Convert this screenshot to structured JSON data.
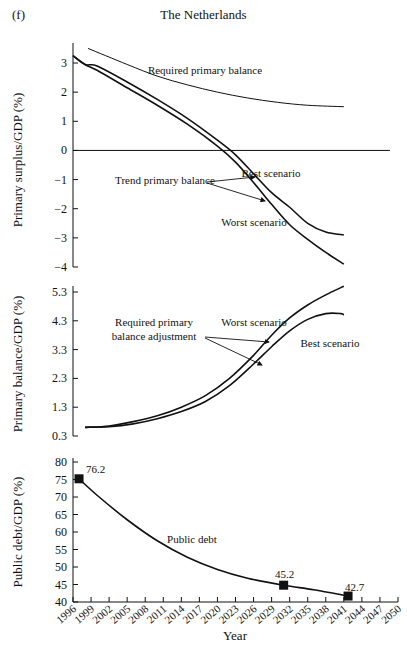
{
  "figure": {
    "panel_label": "(f)",
    "title": "The Netherlands",
    "xlabel": "Year"
  },
  "chart_data": [
    {
      "type": "line",
      "title": "The Netherlands",
      "ylabel": "Primary surplus/GDP (%)",
      "ylim": [
        -4,
        3.5
      ],
      "yticks": [
        3,
        2,
        1,
        0,
        -1,
        -2,
        -3,
        -4
      ],
      "xlim": [
        1996,
        2050
      ],
      "grid": false,
      "reference_line": 0,
      "series": [
        {
          "name": "Required primary balance",
          "x": [
            1998.5,
            2005,
            2010,
            2015,
            2020,
            2025,
            2030,
            2035,
            2041
          ],
          "y": [
            3.5,
            2.95,
            2.55,
            2.25,
            2.0,
            1.8,
            1.65,
            1.55,
            1.5
          ]
        },
        {
          "name": "Trend primary balance – Best scenario",
          "x": [
            1996,
            1998,
            2000,
            2005,
            2010,
            2015,
            2020,
            2023,
            2026,
            2029,
            2032,
            2035,
            2038,
            2041
          ],
          "y": [
            3.25,
            2.95,
            2.9,
            2.35,
            1.75,
            1.1,
            0.35,
            -0.15,
            -0.8,
            -1.45,
            -1.95,
            -2.5,
            -2.8,
            -2.9
          ]
        },
        {
          "name": "Trend primary balance – Worst scenario",
          "x": [
            1996,
            1998,
            2000,
            2005,
            2010,
            2015,
            2020,
            2023,
            2026,
            2029,
            2032,
            2035,
            2038,
            2041
          ],
          "y": [
            3.25,
            2.95,
            2.75,
            2.15,
            1.55,
            0.9,
            0.15,
            -0.4,
            -1.1,
            -1.85,
            -2.55,
            -3.05,
            -3.5,
            -3.9
          ]
        }
      ],
      "annotations": [
        "Required primary balance",
        "Trend primary balance",
        "Best scenario",
        "Worst scenario"
      ]
    },
    {
      "type": "line",
      "ylabel": "Primary balance/GDP (%)",
      "ylim": [
        0.3,
        5.3
      ],
      "yticks": [
        5.3,
        4.3,
        3.3,
        2.3,
        1.3,
        0.3
      ],
      "xlim": [
        1996,
        2050
      ],
      "grid": false,
      "series": [
        {
          "name": "Required primary balance adjustment – Worst scenario",
          "x": [
            1998,
            2002,
            2006,
            2010,
            2014,
            2018,
            2022,
            2026,
            2029,
            2032,
            2035,
            2038,
            2041
          ],
          "y": [
            0.6,
            0.65,
            0.8,
            1.0,
            1.3,
            1.7,
            2.3,
            3.1,
            3.8,
            4.4,
            4.85,
            5.2,
            5.5
          ]
        },
        {
          "name": "Required primary balance adjustment – Best scenario",
          "x": [
            1998,
            2002,
            2006,
            2010,
            2014,
            2018,
            2022,
            2026,
            2029,
            2032,
            2035,
            2038,
            2040.5,
            2041
          ],
          "y": [
            0.6,
            0.62,
            0.72,
            0.9,
            1.15,
            1.5,
            2.05,
            2.8,
            3.4,
            3.95,
            4.35,
            4.55,
            4.55,
            4.5
          ]
        }
      ],
      "annotations": [
        "Required primary balance adjustment",
        "Worst scenario",
        "Best scenario"
      ]
    },
    {
      "type": "line",
      "ylabel": "Public debt/GDP (%)",
      "xlabel": "Year",
      "ylim": [
        40,
        80
      ],
      "yticks": [
        80,
        75,
        70,
        65,
        60,
        55,
        50,
        45,
        40
      ],
      "xlim": [
        1996,
        2050
      ],
      "xticks": [
        "1996",
        "1999",
        "2002",
        "2005",
        "2008",
        "2011",
        "2014",
        "2017",
        "2020",
        "2023",
        "2026",
        "2029",
        "2032",
        "2035",
        "2038",
        "2041",
        "2044",
        "2047",
        "2050"
      ],
      "grid": false,
      "series": [
        {
          "name": "Public debt",
          "x": [
            1997,
            2000,
            2005,
            2010,
            2015,
            2020,
            2025,
            2031,
            2036,
            2041.7
          ],
          "y": [
            75.2,
            70.5,
            63.5,
            57.5,
            52.8,
            49.3,
            46.8,
            44.8,
            43.5,
            41.7
          ]
        }
      ],
      "markers": [
        {
          "x": 1997,
          "y": 75.2,
          "label": "76.2"
        },
        {
          "x": 2031,
          "y": 44.8,
          "label": "45.2"
        },
        {
          "x": 2041.7,
          "y": 41.7,
          "label": "42.7"
        }
      ],
      "annotations": [
        "Public debt"
      ]
    }
  ],
  "labels": {
    "p1_ylabel": "Primary surplus/GDP (%)",
    "p2_ylabel": "Primary balance/GDP (%)",
    "p3_ylabel": "Public debt/GDP (%)",
    "req_primary": "Required primary balance",
    "trend_primary": "Trend primary balance",
    "best": "Best scenario",
    "worst": "Worst scenario",
    "req_adj_1": "Required primary",
    "req_adj_2": "balance adjustment",
    "public_debt": "Public debt",
    "m1": "76.2",
    "m2": "45.2",
    "m3": "42.7",
    "p1_ticks": [
      "3",
      "2",
      "1",
      "0",
      "−1",
      "−2",
      "−3",
      "−4"
    ],
    "p2_ticks": [
      "5.3",
      "4.3",
      "3.3",
      "2.3",
      "1.3",
      "0.3"
    ],
    "p3_ticks": [
      "80",
      "75",
      "70",
      "65",
      "60",
      "55",
      "50",
      "45",
      "40"
    ],
    "x_ticks": [
      "1996",
      "1999",
      "2002",
      "2005",
      "2008",
      "2011",
      "2014",
      "2017",
      "2020",
      "2023",
      "2026",
      "2029",
      "2032",
      "2035",
      "2038",
      "2041",
      "2044",
      "2047",
      "2050"
    ]
  }
}
